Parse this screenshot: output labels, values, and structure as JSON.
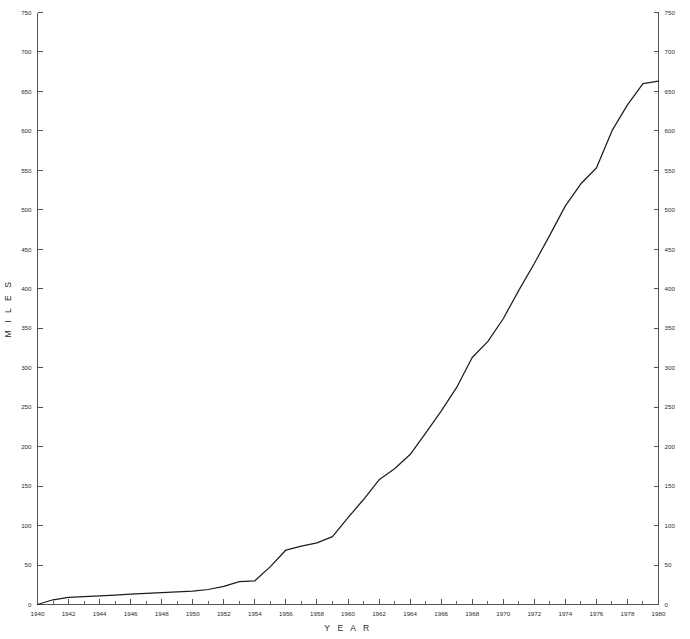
{
  "chart_data": {
    "type": "line",
    "title": "",
    "subtitle": "",
    "xlabel": "Y E A R",
    "ylabel": "M I L E S",
    "xlim": [
      1940,
      1980
    ],
    "ylim": [
      0,
      750
    ],
    "grid": false,
    "legend": null,
    "legend_position": "none",
    "line_color": "#1d1d1d",
    "axis_color": "#555555",
    "background_color": "#ffffff",
    "x_tick_step_major": 2,
    "x_tick_step_minor": 1,
    "y_tick_step_major": 50,
    "x_tick_labels": [
      "1940",
      "1942",
      "1944",
      "1946",
      "1948",
      "1950",
      "1952",
      "1954",
      "1956",
      "1958",
      "1960",
      "1962",
      "1964",
      "1966",
      "1968",
      "1970",
      "1972",
      "1974",
      "1976",
      "1978",
      "1980"
    ],
    "y_tick_labels": [
      "0",
      "50",
      "100",
      "150",
      "200",
      "250",
      "300",
      "350",
      "400",
      "450",
      "500",
      "550",
      "600",
      "650",
      "700",
      "750"
    ],
    "y_axis_right_mirrored": true,
    "y_tick_labels_right": [
      "0",
      "50",
      "100",
      "150",
      "200",
      "250",
      "300",
      "350",
      "400",
      "450",
      "500",
      "550",
      "600",
      "650",
      "700",
      "750"
    ],
    "x": [
      1940,
      1941,
      1942,
      1943,
      1944,
      1945,
      1946,
      1947,
      1948,
      1949,
      1950,
      1951,
      1952,
      1953,
      1954,
      1955,
      1956,
      1957,
      1958,
      1959,
      1960,
      1961,
      1962,
      1963,
      1964,
      1965,
      1966,
      1967,
      1968,
      1969,
      1970,
      1971,
      1972,
      1973,
      1974,
      1975,
      1976,
      1977,
      1978,
      1979,
      1980
    ],
    "values": [
      0,
      6,
      9,
      10,
      11,
      12,
      13,
      14,
      15,
      16,
      17,
      19,
      23,
      29,
      30,
      48,
      69,
      74,
      78,
      86,
      110,
      133,
      158,
      172,
      190,
      217,
      245,
      275,
      313,
      333,
      362,
      398,
      432,
      468,
      505,
      533,
      553,
      600,
      633,
      660,
      663
    ],
    "series": [
      {
        "name": "Miles",
        "x": [
          1940,
          1941,
          1942,
          1943,
          1944,
          1945,
          1946,
          1947,
          1948,
          1949,
          1950,
          1951,
          1952,
          1953,
          1954,
          1955,
          1956,
          1957,
          1958,
          1959,
          1960,
          1961,
          1962,
          1963,
          1964,
          1965,
          1966,
          1967,
          1968,
          1969,
          1970,
          1971,
          1972,
          1973,
          1974,
          1975,
          1976,
          1977,
          1978,
          1979,
          1980
        ],
        "values": [
          0,
          6,
          9,
          10,
          11,
          12,
          13,
          14,
          15,
          16,
          17,
          19,
          23,
          29,
          30,
          48,
          69,
          74,
          78,
          86,
          110,
          133,
          158,
          172,
          190,
          217,
          245,
          275,
          313,
          333,
          362,
          398,
          432,
          468,
          505,
          533,
          553,
          600,
          633,
          660,
          663
        ]
      }
    ],
    "annotations": []
  }
}
